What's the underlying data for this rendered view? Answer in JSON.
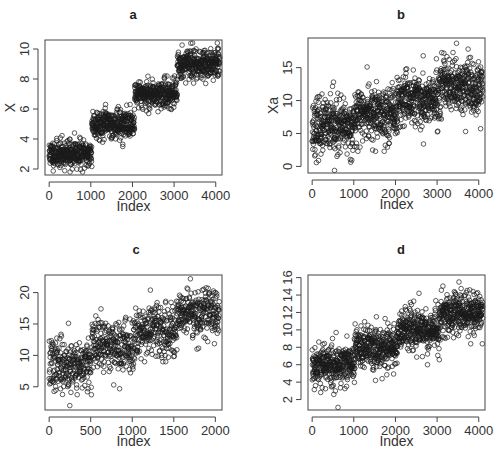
{
  "figure": {
    "width": 503,
    "height": 460,
    "background": "#ffffff",
    "point_color": "#1a1a1a"
  },
  "chart_data": [
    {
      "id": "a",
      "type": "scatter",
      "title": "a",
      "xlabel": "Index",
      "ylabel": "X",
      "xlim": [
        -100,
        4150
      ],
      "ylim": [
        1.6,
        10.6
      ],
      "xticks": [
        0,
        1000,
        2000,
        3000,
        4000
      ],
      "yticks": [
        2,
        4,
        6,
        8,
        10
      ],
      "grid": false,
      "n_points": 4100,
      "segments": [
        {
          "x_start": 0,
          "x_end": 1024,
          "mean": 3.0,
          "sd": 0.45,
          "min_seen": 1.8,
          "max_seen": 4.4
        },
        {
          "x_start": 1025,
          "x_end": 2049,
          "mean": 5.0,
          "sd": 0.45,
          "min_seen": 3.5,
          "max_seen": 6.3
        },
        {
          "x_start": 2050,
          "x_end": 3074,
          "mean": 7.0,
          "sd": 0.45,
          "min_seen": 5.7,
          "max_seen": 8.2
        },
        {
          "x_start": 3075,
          "x_end": 4099,
          "mean": 9.0,
          "sd": 0.45,
          "min_seen": 7.7,
          "max_seen": 10.4
        }
      ],
      "frame_px": {
        "left": 45,
        "top": 40,
        "right": 222,
        "bottom": 175
      },
      "title_px": {
        "x": 133,
        "y": 19
      },
      "seed": 11
    },
    {
      "id": "b",
      "type": "scatter",
      "title": "b",
      "xlabel": "Index",
      "ylabel": "Xa",
      "xlim": [
        -100,
        4150
      ],
      "ylim": [
        -1,
        19.5
      ],
      "xticks": [
        0,
        1000,
        2000,
        3000,
        4000
      ],
      "yticks": [
        0,
        5,
        10,
        15
      ],
      "grid": false,
      "n_points": 4100,
      "segments": [
        {
          "x_start": 0,
          "x_end": 1024,
          "mean": 6.0,
          "sd": 2.0,
          "min_seen": -0.6,
          "max_seen": 12.8
        },
        {
          "x_start": 1025,
          "x_end": 2049,
          "mean": 8.0,
          "sd": 2.0,
          "min_seen": 2.3,
          "max_seen": 15.1
        },
        {
          "x_start": 2050,
          "x_end": 3074,
          "mean": 10.0,
          "sd": 2.0,
          "min_seen": 3.4,
          "max_seen": 16.8
        },
        {
          "x_start": 3075,
          "x_end": 4099,
          "mean": 12.0,
          "sd": 2.0,
          "min_seen": 5.3,
          "max_seen": 18.7
        }
      ],
      "frame_px": {
        "left": 308,
        "top": 38,
        "right": 485,
        "bottom": 173
      },
      "title_px": {
        "x": 401,
        "y": 19
      },
      "seed": 23
    },
    {
      "id": "c",
      "type": "scatter",
      "title": "c",
      "xlabel": "Index",
      "ylabel": "",
      "xlim": [
        -50,
        2080
      ],
      "ylim": [
        1.3,
        22.8
      ],
      "xticks": [
        0,
        500,
        1000,
        1500,
        2000
      ],
      "yticks": [
        5,
        10,
        15,
        20
      ],
      "grid": false,
      "n_points": 2050,
      "segments": [
        {
          "x_start": 0,
          "x_end": 512,
          "mean": 8.5,
          "sd": 2.0,
          "min_seen": 2.0,
          "max_seen": 15.1
        },
        {
          "x_start": 513,
          "x_end": 1024,
          "mean": 11.5,
          "sd": 2.0,
          "min_seen": 4.7,
          "max_seen": 17.4
        },
        {
          "x_start": 1025,
          "x_end": 1537,
          "mean": 14.0,
          "sd": 2.0,
          "min_seen": 9.0,
          "max_seen": 20.4
        },
        {
          "x_start": 1538,
          "x_end": 2049,
          "mean": 17.0,
          "sd": 2.0,
          "min_seen": 11.0,
          "max_seen": 22.2
        }
      ],
      "frame_px": {
        "left": 45,
        "top": 275,
        "right": 222,
        "bottom": 410
      },
      "title_px": {
        "x": 136,
        "y": 254
      },
      "seed": 37
    },
    {
      "id": "d",
      "type": "scatter",
      "title": "d",
      "xlabel": "Index",
      "ylabel": "",
      "xlim": [
        -100,
        4150
      ],
      "ylim": [
        0.8,
        16.3
      ],
      "xticks": [
        0,
        1000,
        2000,
        3000,
        4000
      ],
      "yticks": [
        2,
        4,
        6,
        8,
        10,
        12,
        14,
        16
      ],
      "grid": false,
      "n_points": 4100,
      "segments": [
        {
          "x_start": 0,
          "x_end": 1024,
          "mean": 6.0,
          "sd": 1.2,
          "min_seen": 1.1,
          "max_seen": 9.7
        },
        {
          "x_start": 1025,
          "x_end": 2049,
          "mean": 8.0,
          "sd": 1.2,
          "min_seen": 4.2,
          "max_seen": 11.5
        },
        {
          "x_start": 2050,
          "x_end": 3074,
          "mean": 10.0,
          "sd": 1.2,
          "min_seen": 6.0,
          "max_seen": 14.2
        },
        {
          "x_start": 3075,
          "x_end": 4099,
          "mean": 12.0,
          "sd": 1.2,
          "min_seen": 8.4,
          "max_seen": 15.5
        }
      ],
      "frame_px": {
        "left": 308,
        "top": 275,
        "right": 485,
        "bottom": 410
      },
      "title_px": {
        "x": 401,
        "y": 254
      },
      "seed": 53
    }
  ]
}
